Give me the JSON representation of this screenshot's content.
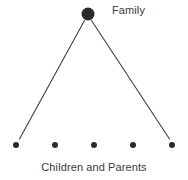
{
  "diagram": {
    "type": "hierarchy-tree",
    "width": 188,
    "height": 180,
    "background_color": "#ffffff",
    "root": {
      "label": "Family",
      "label_x": 112,
      "label_y": 4,
      "node_x": 88,
      "node_y": 14,
      "node_radius": 6.5,
      "node_color": "#2b2b2b"
    },
    "leaves": {
      "caption": "Children and Parents",
      "caption_y": 161,
      "count": 5,
      "node_y": 145,
      "node_radius": 3,
      "node_color": "#2b2b2b",
      "nodes": [
        {
          "cx": 16,
          "cy": 145
        },
        {
          "cx": 55,
          "cy": 145
        },
        {
          "cx": 94,
          "cy": 145
        },
        {
          "cx": 133,
          "cy": 145
        },
        {
          "cx": 172,
          "cy": 145
        }
      ]
    },
    "edges": {
      "color": "#3f3f3f",
      "width": 1.1,
      "lines": [
        {
          "name": "edge-root-to-leftmost",
          "x1": 84.5,
          "y1": 20.5,
          "x2": 19.5,
          "y2": 139
        },
        {
          "name": "edge-root-to-rightmost",
          "x1": 91.5,
          "y1": 20.5,
          "x2": 169.5,
          "y2": 139
        }
      ]
    },
    "icons": {
      "root_node": "filled-circle-icon",
      "leaf_node": "filled-dot-icon"
    }
  }
}
